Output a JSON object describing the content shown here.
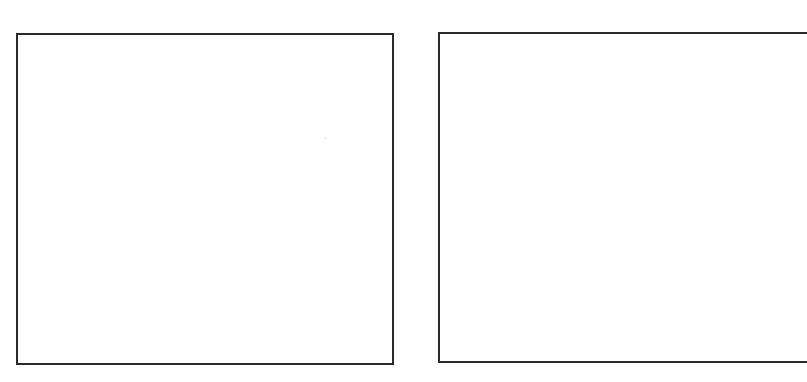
{
  "panels": [
    {
      "id": "left",
      "content": ""
    },
    {
      "id": "right",
      "content": ""
    }
  ],
  "colors": {
    "border": "#2a2a2a",
    "background": "#ffffff"
  }
}
